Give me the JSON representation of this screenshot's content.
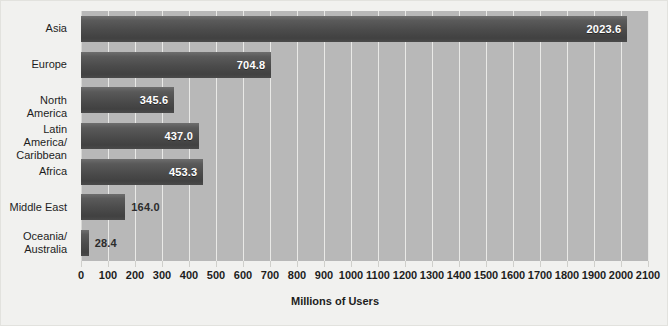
{
  "chart_data": {
    "type": "bar",
    "orientation": "horizontal",
    "title": "",
    "xlabel": "Millions of Users",
    "ylabel": "",
    "categories": [
      "Asia",
      "Europe",
      "North America",
      "Latin America/\nCaribbean",
      "Africa",
      "Middle East",
      "Oceania/\nAustralia"
    ],
    "values": [
      2023.6,
      704.8,
      345.6,
      437.0,
      453.3,
      164.0,
      28.4
    ],
    "value_labels": [
      "2023.6",
      "704.8",
      "345.6",
      "437.0",
      "453.3",
      "164.0",
      "28.4"
    ],
    "xlim": [
      0,
      2100
    ],
    "xticks": [
      0,
      100,
      200,
      300,
      400,
      500,
      600,
      700,
      800,
      900,
      1000,
      1100,
      1200,
      1300,
      1400,
      1500,
      1600,
      1700,
      1800,
      1900,
      2000,
      2100
    ],
    "xtick_labels": [
      "0",
      "100",
      "200",
      "300",
      "400",
      "500",
      "600",
      "700",
      "800",
      "900",
      "1000",
      "1100",
      "1200",
      "1300",
      "1400",
      "1500",
      "1600",
      "1700",
      "1800",
      "1900",
      "2000",
      "2100"
    ],
    "grid": true,
    "legend": false,
    "colors": {
      "plot_background": "#b8b8b8",
      "figure_background": "#f1f1ef",
      "gridline": "#e9e9e7",
      "bar_top": "#6e6e6e",
      "bar_bottom": "#414141",
      "label_inside": "#ffffff",
      "label_outside": "#2c2c2c",
      "text": "#1d1d1d"
    }
  }
}
